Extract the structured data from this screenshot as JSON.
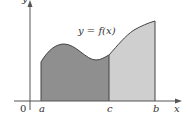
{
  "diagram": {
    "function_label": "y = f(x)",
    "axis_x_label": "x",
    "axis_y_label": "y",
    "origin_label": "0",
    "points": {
      "a": "a",
      "c": "c",
      "b": "b"
    },
    "colors": {
      "region_a_c": "#8f8f8f",
      "region_c_b": "#cfcfcf",
      "axis": "#555555",
      "curve": "#444444"
    }
  }
}
